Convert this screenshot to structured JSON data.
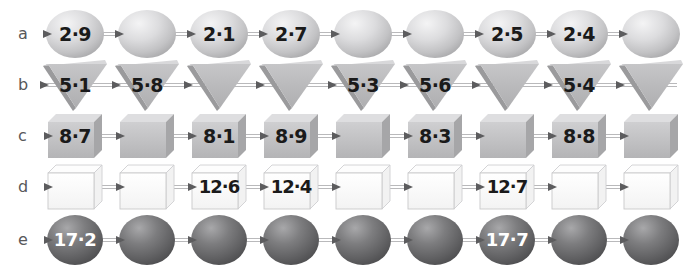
{
  "figure": {
    "title": "",
    "background": "#ffffff",
    "row_label_color": "#58585a",
    "axis_color": "#b9b9bb",
    "arrow_color": "#5c5c5e"
  },
  "chart_data": {
    "type": "diagram",
    "title": "",
    "xlabel": "",
    "ylabel": "",
    "rows": [
      {
        "label": "a",
        "shape": "sphere",
        "shape_fill": "#d2d2d4",
        "text_color": "#1a1a1a",
        "count": 9,
        "values": [
          "2·9",
          "",
          "2·1",
          "2·7",
          "",
          "",
          "2·5",
          "2·4",
          ""
        ],
        "numeric_values": [
          2.9,
          null,
          2.1,
          2.7,
          null,
          null,
          2.5,
          2.4,
          null
        ]
      },
      {
        "label": "b",
        "shape": "triangle-down",
        "shape_fill": "#b4b4b6",
        "text_color": "#1a1a1a",
        "count": 9,
        "values": [
          "5·1",
          "5·8",
          "",
          "",
          "5·3",
          "5·6",
          "",
          "5·4",
          ""
        ],
        "numeric_values": [
          5.1,
          5.8,
          null,
          null,
          5.3,
          5.6,
          null,
          5.4,
          null
        ]
      },
      {
        "label": "c",
        "shape": "cube",
        "shape_fill": "#c0c0c2",
        "text_color": "#1a1a1a",
        "count": 9,
        "values": [
          "8·7",
          "",
          "8·1",
          "8·9",
          "",
          "8·3",
          "",
          "8·8",
          ""
        ],
        "numeric_values": [
          8.7,
          null,
          8.1,
          8.9,
          null,
          8.3,
          null,
          8.8,
          null
        ]
      },
      {
        "label": "d",
        "shape": "cube-white",
        "shape_fill": "#fbfbfb",
        "text_color": "#1a1a1a",
        "count": 9,
        "values": [
          "",
          "",
          "12·6",
          "12·4",
          "",
          "",
          "12·7",
          "",
          ""
        ],
        "numeric_values": [
          null,
          null,
          12.6,
          12.4,
          null,
          null,
          12.7,
          null,
          null
        ]
      },
      {
        "label": "e",
        "shape": "sphere-dark",
        "shape_fill": "#6e6e70",
        "text_color": "#ffffff",
        "count": 9,
        "values": [
          "17·2",
          "",
          "",
          "",
          "",
          "",
          "17·7",
          "",
          ""
        ],
        "numeric_values": [
          17.2,
          null,
          null,
          null,
          null,
          null,
          17.7,
          null,
          null
        ]
      }
    ]
  }
}
